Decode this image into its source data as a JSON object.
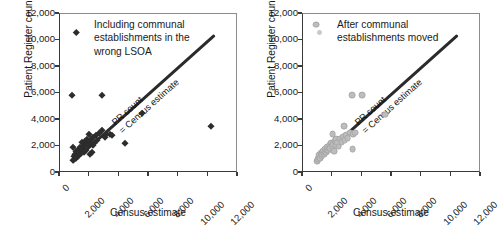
{
  "chart_data": [
    {
      "panel": "left",
      "type": "scatter",
      "title": "Including communal establishments in the wrong LSOA",
      "title_lines": [
        "Including communal",
        "establishments in the",
        "wrong LSOA"
      ],
      "xlabel": "Census estimate",
      "ylabel": "Patient Register count",
      "xlim": [
        0,
        12000
      ],
      "ylim": [
        0,
        12000
      ],
      "xticks": [
        "0",
        "2,000",
        "4,000",
        "6,000",
        "8,000",
        "10,000",
        "12,000"
      ],
      "yticks": [
        "0",
        "2,000",
        "4,000",
        "6,000",
        "8,000",
        "10,000",
        "12,000"
      ],
      "xtick_values": [
        0,
        2000,
        4000,
        6000,
        8000,
        10000,
        12000
      ],
      "ytick_values": [
        0,
        2000,
        4000,
        6000,
        8000,
        10000,
        12000
      ],
      "grid": false,
      "legend_position": "top-left-inside",
      "marker": "diamond",
      "marker_color": "#2d2d2d",
      "reference_line": {
        "label_lines": [
          "PR count",
          "= Census estimate"
        ],
        "label": "PR count = Census estimate",
        "from": [
          800,
          800
        ],
        "to": [
          10400,
          10400
        ],
        "color": "#2b2b2b"
      },
      "points": [
        [
          800,
          5900
        ],
        [
          850,
          2000
        ],
        [
          900,
          1000
        ],
        [
          950,
          1250
        ],
        [
          1000,
          1450
        ],
        [
          1050,
          1150
        ],
        [
          1100,
          1650
        ],
        [
          1150,
          1400
        ],
        [
          1200,
          1300
        ],
        [
          1250,
          1800
        ],
        [
          1300,
          1600
        ],
        [
          1350,
          2000
        ],
        [
          1400,
          1500
        ],
        [
          1450,
          1750
        ],
        [
          1500,
          2350
        ],
        [
          1550,
          1900
        ],
        [
          1600,
          2050
        ],
        [
          1620,
          1600
        ],
        [
          1650,
          2200
        ],
        [
          1700,
          2400
        ],
        [
          1750,
          1700
        ],
        [
          1800,
          2250
        ],
        [
          1850,
          2550
        ],
        [
          1900,
          2100
        ],
        [
          1950,
          2950
        ],
        [
          2000,
          1450
        ],
        [
          2050,
          2350
        ],
        [
          2100,
          2550
        ],
        [
          2150,
          1550
        ],
        [
          2200,
          2100
        ],
        [
          2250,
          2700
        ],
        [
          2300,
          2250
        ],
        [
          2400,
          2900
        ],
        [
          2500,
          2500
        ],
        [
          2600,
          3050
        ],
        [
          2800,
          5900
        ],
        [
          2850,
          3250
        ],
        [
          3000,
          2700
        ],
        [
          3100,
          2950
        ],
        [
          3400,
          2950
        ],
        [
          3500,
          2900
        ],
        [
          4400,
          2300
        ],
        [
          5550,
          4500
        ],
        [
          10200,
          3550
        ]
      ]
    },
    {
      "panel": "right",
      "type": "scatter",
      "title": "After communal establishments moved",
      "title_lines": [
        "After communal",
        "establishments moved"
      ],
      "xlabel": "Census estimate",
      "ylabel": "Patient Register count",
      "xlim": [
        0,
        12000
      ],
      "ylim": [
        0,
        12000
      ],
      "xticks": [
        "0",
        "2,000",
        "4,000",
        "6,000",
        "8,000",
        "10,000",
        "12,000"
      ],
      "yticks": [
        "0",
        "2,000",
        "4,000",
        "6,000",
        "8,000",
        "10,000",
        "12,000"
      ],
      "xtick_values": [
        0,
        2000,
        4000,
        6000,
        8000,
        10000,
        12000
      ],
      "ytick_values": [
        0,
        2000,
        4000,
        6000,
        8000,
        10000,
        12000
      ],
      "grid": false,
      "legend_position": "top-left-inside",
      "marker": "circle",
      "marker_color": "#bdbdbd",
      "reference_line": {
        "label_lines": [
          "PR count",
          "= Census estimate"
        ],
        "label": "PR count = Census estimate",
        "from": [
          800,
          800
        ],
        "to": [
          10400,
          10400
        ],
        "color": "#2b2b2b"
      },
      "points": [
        [
          900,
          11200
        ],
        [
          950,
          900
        ],
        [
          1000,
          1050
        ],
        [
          1050,
          1200
        ],
        [
          1100,
          1350
        ],
        [
          1150,
          1150
        ],
        [
          1200,
          1500
        ],
        [
          1250,
          1300
        ],
        [
          1300,
          1450
        ],
        [
          1350,
          1650
        ],
        [
          1400,
          1400
        ],
        [
          1450,
          1550
        ],
        [
          1500,
          1800
        ],
        [
          1550,
          1600
        ],
        [
          1600,
          1750
        ],
        [
          1650,
          1950
        ],
        [
          1700,
          1700
        ],
        [
          1750,
          1850
        ],
        [
          1800,
          2100
        ],
        [
          1850,
          1900
        ],
        [
          1900,
          2250
        ],
        [
          1950,
          2050
        ],
        [
          2000,
          2950
        ],
        [
          2050,
          2200
        ],
        [
          2100,
          1650
        ],
        [
          2150,
          2400
        ],
        [
          2200,
          2100
        ],
        [
          2250,
          2550
        ],
        [
          2300,
          2300
        ],
        [
          2400,
          2000
        ],
        [
          2500,
          2600
        ],
        [
          2600,
          2350
        ],
        [
          2700,
          2750
        ],
        [
          2750,
          3550
        ],
        [
          2800,
          2500
        ],
        [
          2900,
          2850
        ],
        [
          3000,
          2650
        ],
        [
          3150,
          3050
        ],
        [
          3300,
          5900
        ],
        [
          3350,
          1800
        ],
        [
          3400,
          2950
        ],
        [
          3500,
          3050
        ],
        [
          4000,
          5900
        ],
        [
          5550,
          4400
        ]
      ]
    }
  ]
}
